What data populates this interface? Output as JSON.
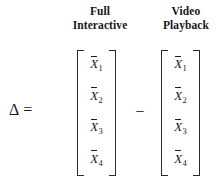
{
  "figure": {
    "background_color": "#ffffff",
    "text_color": "#1a1a1a",
    "lhs": {
      "delta_symbol": "Δ",
      "equals_symbol": "="
    },
    "operator": {
      "minus_symbol": "−"
    },
    "columns": [
      {
        "id": "full-interactive",
        "header_line_1": "Full",
        "header_line_2": "Interactive"
      },
      {
        "id": "video-playback",
        "header_line_1": "Video",
        "header_line_2": "Playback"
      }
    ],
    "matrices": [
      {
        "id": "full-interactive",
        "left_bracket": "[",
        "right_bracket": "]",
        "cells": [
          {
            "variable": "X",
            "subscript": "1"
          },
          {
            "variable": "X",
            "subscript": "2"
          },
          {
            "variable": "X",
            "subscript": "3"
          },
          {
            "variable": "X",
            "subscript": "4"
          }
        ]
      },
      {
        "id": "video-playback",
        "left_bracket": "[",
        "right_bracket": "]",
        "cells": [
          {
            "variable": "X",
            "subscript": "1"
          },
          {
            "variable": "X",
            "subscript": "2"
          },
          {
            "variable": "X",
            "subscript": "3"
          },
          {
            "variable": "X",
            "subscript": "4"
          }
        ]
      }
    ]
  }
}
